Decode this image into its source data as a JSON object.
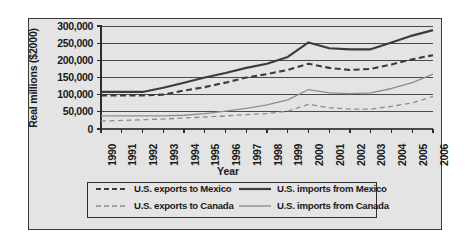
{
  "figure": {
    "background": "#e4e4e4",
    "border_color": "#3a3a3a"
  },
  "axis": {
    "ylabel": "Real millions ($2000)",
    "xlabel": "Year",
    "yticks": [
      "300,000",
      "250,000",
      "200,000",
      "150,000",
      "100,000",
      "50,000",
      "0"
    ],
    "xticks": [
      "1990",
      "1991",
      "1992",
      "1993",
      "1994",
      "1995",
      "1996",
      "1997",
      "1998",
      "1999",
      "2000",
      "2001",
      "2002",
      "2003",
      "2004",
      "2005",
      "2006"
    ]
  },
  "legend": {
    "items": [
      {
        "label": "U.S. exports to Mexico",
        "style": "dashed",
        "color": "#3b3b3b",
        "width": 2.2
      },
      {
        "label": "U.S. imports from Mexico",
        "style": "solid",
        "color": "#3b3b3b",
        "width": 2.2
      },
      {
        "label": "U.S. exports to Canada",
        "style": "dashed",
        "color": "#8d8d8d",
        "width": 1.4
      },
      {
        "label": "U.S. imports from Canada",
        "style": "solid",
        "color": "#8d8d8d",
        "width": 1.4
      }
    ]
  },
  "chart_data": {
    "type": "line",
    "title": "",
    "xlabel": "Year",
    "ylabel": "Real millions ($2000)",
    "ylim": [
      0,
      300000
    ],
    "ytick_step": 50000,
    "grid": true,
    "legend_position": "below-axis",
    "x": [
      1990,
      1991,
      1992,
      1993,
      1994,
      1995,
      1996,
      1997,
      1998,
      1999,
      2000,
      2001,
      2002,
      2003,
      2004,
      2005,
      2006
    ],
    "series": [
      {
        "name": "U.S. imports from Mexico",
        "style": "solid",
        "color": "#3b3b3b",
        "values": [
          108000,
          108000,
          108000,
          120000,
          135000,
          150000,
          163000,
          178000,
          190000,
          210000,
          252000,
          235000,
          232000,
          232000,
          252000,
          272000,
          288000
        ]
      },
      {
        "name": "U.S. exports to Mexico",
        "style": "dashed",
        "color": "#3b3b3b",
        "values": [
          98000,
          98000,
          98000,
          100000,
          112000,
          122000,
          135000,
          150000,
          160000,
          172000,
          190000,
          178000,
          172000,
          175000,
          188000,
          203000,
          215000
        ]
      },
      {
        "name": "U.S. imports from Canada",
        "style": "solid",
        "color": "#8d8d8d",
        "values": [
          38000,
          38000,
          38000,
          38000,
          40000,
          45000,
          52000,
          60000,
          70000,
          85000,
          115000,
          105000,
          103000,
          105000,
          118000,
          135000,
          160000
        ]
      },
      {
        "name": "U.S. exports to Canada",
        "style": "dashed",
        "color": "#8d8d8d",
        "values": [
          23000,
          25000,
          27000,
          29000,
          32000,
          35000,
          38000,
          42000,
          45000,
          52000,
          72000,
          62000,
          58000,
          58000,
          66000,
          76000,
          95000
        ]
      }
    ]
  }
}
